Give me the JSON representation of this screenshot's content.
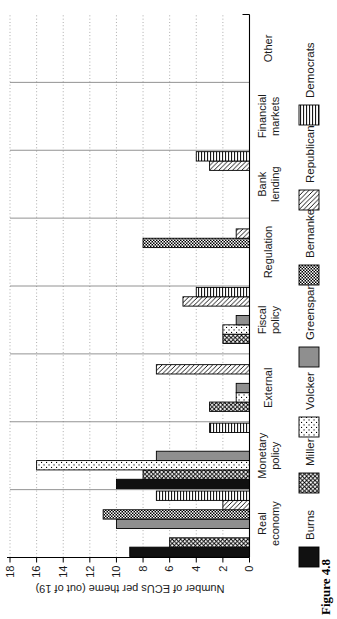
{
  "figure": {
    "caption": "Figure 4.8",
    "rotation": "chart is rotated 90 degrees counterclockwise on the page"
  },
  "chart_data": {
    "type": "bar",
    "title": "",
    "ylabel": "Number of ECUs per theme (out of 19)",
    "ylim": [
      0,
      18
    ],
    "yticks": [
      0,
      2,
      4,
      6,
      8,
      10,
      12,
      14,
      16,
      18
    ],
    "grid": "dotted gridline at every tick, solid separator lines between category groups",
    "legend_position": "bottom",
    "categories": [
      "Real economy",
      "Monetary policy",
      "External",
      "Fiscal policy",
      "Regulation",
      "Bank lending",
      "Financial markets",
      "Other"
    ],
    "category_label_lines": [
      [
        "Real",
        "economy"
      ],
      [
        "Monetary",
        "policy"
      ],
      [
        "External"
      ],
      [
        "Fiscal",
        "policy"
      ],
      [
        "Regulation"
      ],
      [
        "Bank",
        "lending"
      ],
      [
        "Financial",
        "markets"
      ],
      [
        "Other"
      ]
    ],
    "series": [
      {
        "name": "Burns",
        "pattern": "solid-black",
        "values": [
          9,
          10,
          0,
          0,
          0,
          0,
          0,
          0
        ]
      },
      {
        "name": "Miller",
        "pattern": "crosshatch",
        "values": [
          6,
          8,
          3,
          2,
          0,
          0,
          0,
          0
        ]
      },
      {
        "name": "Volcker",
        "pattern": "dots",
        "values": [
          0,
          16,
          1,
          2,
          0,
          0,
          0,
          0
        ]
      },
      {
        "name": "Greenspan",
        "pattern": "solid-gray",
        "values": [
          10,
          7,
          1,
          1,
          0,
          0,
          0,
          0
        ]
      },
      {
        "name": "Bernanke",
        "pattern": "checkerboard",
        "values": [
          11,
          0,
          0,
          0,
          8,
          0,
          0,
          0
        ]
      },
      {
        "name": "Republicans",
        "pattern": "diagonal",
        "values": [
          2,
          0,
          7,
          5,
          1,
          3,
          0,
          0
        ]
      },
      {
        "name": "Democrats",
        "pattern": "stripes",
        "values": [
          7,
          3,
          0,
          4,
          0,
          4,
          0,
          0
        ]
      }
    ],
    "colors": {
      "background": "#ffffff",
      "bar_outline": "#000000",
      "solid_black_fill": "#111111",
      "solid_gray_fill": "#8f8f8f",
      "grid": "#9a9a9a",
      "separator": "#777777",
      "axis": "#000000",
      "text": "#1a1a1a"
    }
  }
}
